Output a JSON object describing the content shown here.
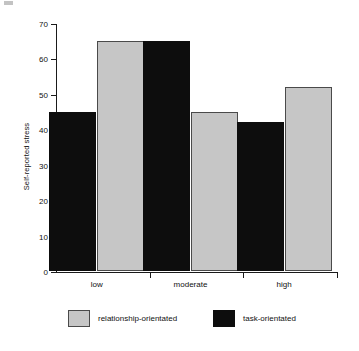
{
  "chart_data": {
    "type": "bar",
    "title": "",
    "xlabel": "",
    "ylabel": "Self-reported stress",
    "ylim": [
      0,
      70
    ],
    "yticks": [
      0,
      10,
      20,
      30,
      40,
      50,
      60,
      70
    ],
    "ytick_labels": [
      "0",
      "10",
      "20",
      "30",
      "40",
      "50",
      "60",
      "70"
    ],
    "grid": false,
    "legend_position": "bottom",
    "categories": [
      "low",
      "moderate",
      "high"
    ],
    "series": [
      {
        "name": "task-orientated",
        "color": "#0d0d0d",
        "values": [
          45,
          65,
          42
        ]
      },
      {
        "name": "relationship-orientated",
        "color": "#c6c6c6",
        "values": [
          65,
          45,
          52
        ]
      }
    ],
    "series_draw_order": [
      "task-orientated",
      "relationship-orientated"
    ]
  },
  "legend": {
    "entries": [
      {
        "label": "relationship-orientated",
        "swatch": "gray"
      },
      {
        "label": "task-orientated",
        "swatch": "black"
      }
    ]
  },
  "colors": {
    "relationship": "#c6c6c6",
    "task": "#0d0d0d",
    "axis": "#1a1a1a",
    "background": "#ffffff"
  }
}
